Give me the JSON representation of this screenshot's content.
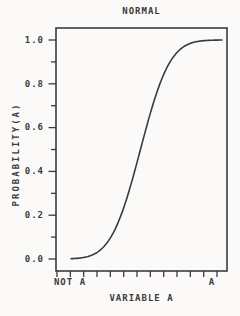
{
  "chart_data": {
    "type": "line",
    "title": "NORMAL",
    "xlabel": "VARIABLE A",
    "ylabel": "PROBABILITY(A)",
    "x_tick_labels": [
      "NOT A",
      "A"
    ],
    "y_tick_labels": [
      "0.0",
      "0.2",
      "0.4",
      "0.6",
      "0.8",
      "1.0"
    ],
    "ylim": [
      0.0,
      1.0
    ],
    "y_label_step": 0.2,
    "y_minor_ticks_between_labels": 1,
    "x_minor_tick_count": 13,
    "grid": false,
    "frame": "box",
    "line_color": "#3b3b3b",
    "background_color": "#fbfaf8",
    "distribution": {
      "type": "normal-cdf",
      "mu_norm": 0.46,
      "sigma_norm": 0.153
    },
    "points": [
      [
        0.0,
        0.001
      ],
      [
        0.05,
        0.004
      ],
      [
        0.1,
        0.009
      ],
      [
        0.15,
        0.021
      ],
      [
        0.2,
        0.045
      ],
      [
        0.25,
        0.085
      ],
      [
        0.3,
        0.148
      ],
      [
        0.35,
        0.236
      ],
      [
        0.4,
        0.348
      ],
      [
        0.45,
        0.474
      ],
      [
        0.5,
        0.603
      ],
      [
        0.55,
        0.722
      ],
      [
        0.6,
        0.82
      ],
      [
        0.65,
        0.893
      ],
      [
        0.7,
        0.942
      ],
      [
        0.75,
        0.971
      ],
      [
        0.8,
        0.987
      ],
      [
        0.85,
        0.995
      ],
      [
        0.9,
        0.998
      ],
      [
        0.95,
        0.999
      ],
      [
        1.0,
        1.0
      ]
    ]
  }
}
